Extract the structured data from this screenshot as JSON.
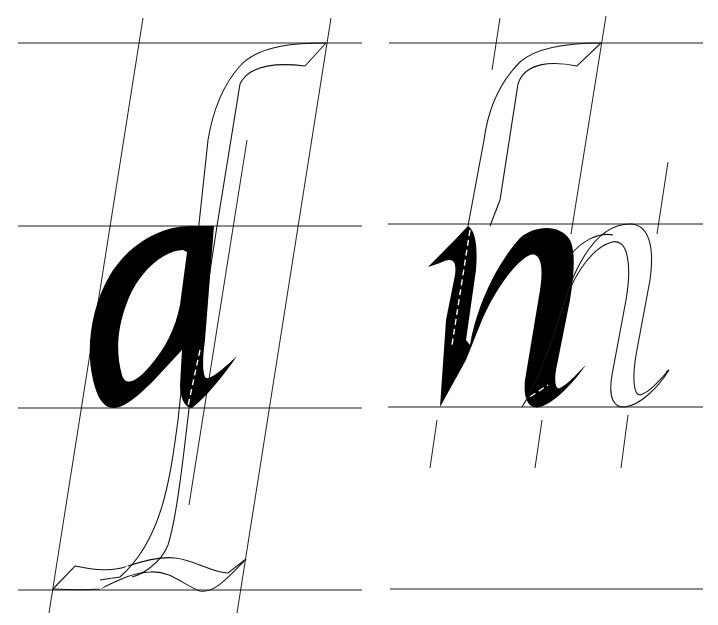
{
  "figure": {
    "kind": "italic letterform construction diagram",
    "panels": [
      {
        "id": "left",
        "letter": "a",
        "ghost_letter": "long descender/ascender stroke (f / long-s form)",
        "horizontal_guides_y": [
          43,
          226,
          408,
          590
        ],
        "slant_guides": 3
      },
      {
        "id": "right",
        "letter": "n",
        "ghost_letter": "n (outlined, following)",
        "horizontal_guides_y": [
          43,
          224,
          407,
          589
        ],
        "slant_tick_marks": 8
      }
    ],
    "colors": {
      "ink": "#000000",
      "guide": "#1a1a1a",
      "background": "#ffffff"
    }
  }
}
